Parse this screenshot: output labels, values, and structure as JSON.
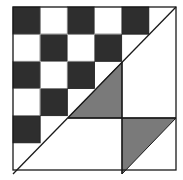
{
  "diagram": {
    "colors": {
      "background": "#ffffff",
      "dark_square": "#2e2e2e",
      "gray_triangle": "#7a7a7a",
      "line": "#1a1a1a"
    },
    "outer_square": {
      "x": 13,
      "y": 7,
      "size": 163
    },
    "grid": {
      "rows": 6,
      "cols": 6
    },
    "dark_cells": [
      [
        0,
        0
      ],
      [
        0,
        2
      ],
      [
        0,
        4
      ],
      [
        1,
        1
      ],
      [
        1,
        3
      ],
      [
        2,
        0
      ],
      [
        2,
        2
      ],
      [
        3,
        1
      ],
      [
        4,
        0
      ]
    ],
    "gray_triangles": [
      {
        "name": "center-gray-triangle",
        "points": "68,118 122,62 122,118"
      },
      {
        "name": "bottom-right-gray-triangle",
        "points": "122,118 176,118 122,174"
      }
    ],
    "lines": [
      {
        "name": "main-diagonal",
        "x1": 13,
        "y1": 174,
        "x2": 176,
        "y2": 7
      },
      {
        "name": "horizontal-divider",
        "x1": 68,
        "y1": 118,
        "x2": 176,
        "y2": 118
      },
      {
        "name": "vertical-divider",
        "x1": 122,
        "y1": 62,
        "x2": 122,
        "y2": 174
      }
    ]
  }
}
